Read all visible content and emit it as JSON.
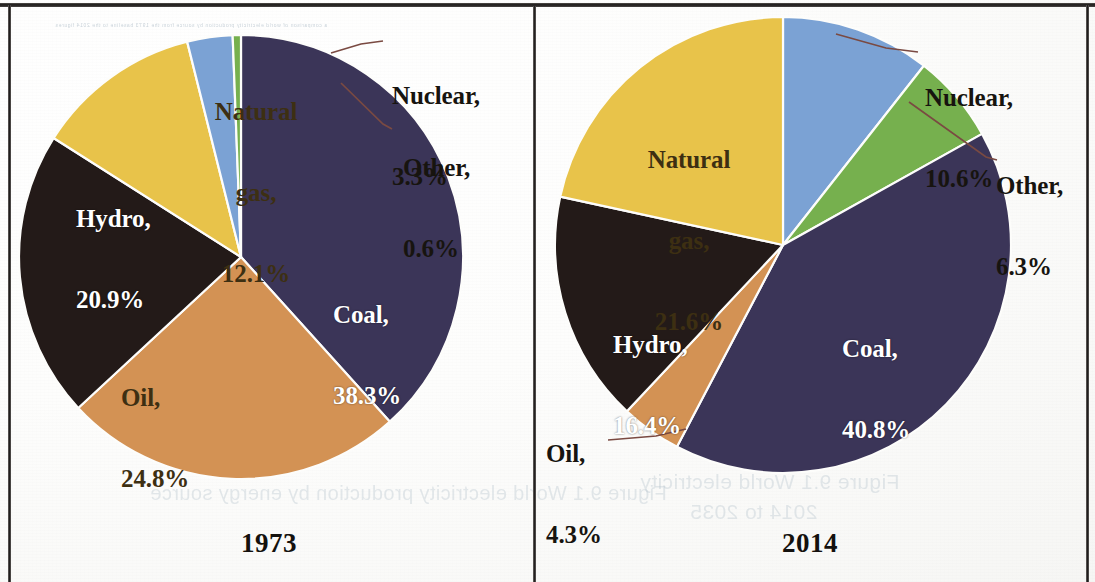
{
  "figure": {
    "kind": "two-pie-comparison",
    "leader_line_color": "#7A4A42",
    "bleed_through": {
      "caption_a": "Figure 9.1  World electricity production by energy source",
      "caption_b": "Figure 9.1  World electricity",
      "caption_c": "2014 to 2035",
      "top_line": "a comparison of world electricity production by source from the 1973 baseline to the 2014 figures"
    }
  },
  "palette": {
    "coal": "#3B3558",
    "oil": "#D39254",
    "hydro": "#231A18",
    "natural_gas": "#E8C34A",
    "nuclear": "#7BA2D4",
    "other": "#76B04E"
  },
  "panels": [
    {
      "id": "1973",
      "year_label": "1973"
    },
    {
      "id": "2014",
      "year_label": "2014"
    }
  ],
  "labels": {
    "p1973": {
      "natural_gas": {
        "name": "Natural",
        "name2": "gas,",
        "value": "12.1%"
      },
      "hydro": {
        "name": "Hydro,",
        "value": "20.9%"
      },
      "oil": {
        "name": "Oil,",
        "value": "24.8%"
      },
      "coal": {
        "name": "Coal,",
        "value": "38.3%"
      },
      "nuclear": {
        "name": "Nuclear,",
        "value": "3.3%"
      },
      "other": {
        "name": "Other,",
        "value": "0.6%"
      }
    },
    "p2014": {
      "natural_gas": {
        "name": "Natural",
        "name2": "gas,",
        "value": "21.6%"
      },
      "hydro": {
        "name": "Hydro,",
        "value": "16.4%"
      },
      "oil": {
        "name": "Oil,",
        "value": "4.3%"
      },
      "coal": {
        "name": "Coal,",
        "value": "40.8%"
      },
      "nuclear": {
        "name": "Nuclear,",
        "value": "10.6%"
      },
      "other": {
        "name": "Other,",
        "value": "6.3%"
      }
    }
  },
  "chart_data": [
    {
      "type": "pie",
      "title": "1973",
      "subtitle": "",
      "xlabel": "",
      "ylabel": "",
      "unit": "percent",
      "total": 100.0,
      "start_angle_deg": -90,
      "direction": "clockwise",
      "legend": "none (labels on slices and with leader lines)",
      "categories": [
        "Coal",
        "Oil",
        "Hydro",
        "Natural gas",
        "Nuclear",
        "Other"
      ],
      "values": [
        38.3,
        24.8,
        20.9,
        12.1,
        3.3,
        0.6
      ],
      "colors": [
        "#3B3558",
        "#D39254",
        "#231A18",
        "#E8C34A",
        "#7BA2D4",
        "#76B04E"
      ],
      "slices": [
        {
          "label": "Coal",
          "value": 38.3,
          "display": "Coal, 38.3%",
          "color": "#3B3558",
          "label_placement": "inside"
        },
        {
          "label": "Oil",
          "value": 24.8,
          "display": "Oil, 24.8%",
          "color": "#D39254",
          "label_placement": "inside"
        },
        {
          "label": "Hydro",
          "value": 20.9,
          "display": "Hydro, 20.9%",
          "color": "#231A18",
          "label_placement": "inside"
        },
        {
          "label": "Natural gas",
          "value": 12.1,
          "display": "Natural gas, 12.1%",
          "color": "#E8C34A",
          "label_placement": "inside"
        },
        {
          "label": "Nuclear",
          "value": 3.3,
          "display": "Nuclear, 3.3%",
          "color": "#7BA2D4",
          "label_placement": "outside-leader"
        },
        {
          "label": "Other",
          "value": 0.6,
          "display": "Other, 0.6%",
          "color": "#76B04E",
          "label_placement": "outside-leader"
        }
      ]
    },
    {
      "type": "pie",
      "title": "2014",
      "subtitle": "",
      "xlabel": "",
      "ylabel": "",
      "unit": "percent",
      "total": 100.0,
      "start_angle_deg": -90,
      "direction": "clockwise",
      "legend": "none (labels on slices and with leader lines)",
      "categories": [
        "Nuclear",
        "Other",
        "Coal",
        "Oil",
        "Hydro",
        "Natural gas"
      ],
      "values": [
        10.6,
        6.3,
        40.8,
        4.3,
        16.4,
        21.6
      ],
      "colors": [
        "#7BA2D4",
        "#76B04E",
        "#3B3558",
        "#D39254",
        "#231A18",
        "#E8C34A"
      ],
      "slices": [
        {
          "label": "Nuclear",
          "value": 10.6,
          "display": "Nuclear, 10.6%",
          "color": "#7BA2D4",
          "label_placement": "outside-leader"
        },
        {
          "label": "Other",
          "value": 6.3,
          "display": "Other, 6.3%",
          "color": "#76B04E",
          "label_placement": "outside-leader"
        },
        {
          "label": "Coal",
          "value": 40.8,
          "display": "Coal, 40.8%",
          "color": "#3B3558",
          "label_placement": "inside"
        },
        {
          "label": "Oil",
          "value": 4.3,
          "display": "Oil, 4.3%",
          "color": "#D39254",
          "label_placement": "outside-leader"
        },
        {
          "label": "Hydro",
          "value": 16.4,
          "display": "Hydro, 16.4%",
          "color": "#231A18",
          "label_placement": "inside"
        },
        {
          "label": "Natural gas",
          "value": 21.6,
          "display": "Natural gas, 21.6%",
          "color": "#E8C34A",
          "label_placement": "inside"
        }
      ]
    }
  ]
}
